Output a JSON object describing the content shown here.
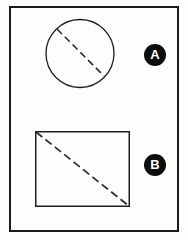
{
  "figure": {
    "background_color": "#fdfdfc",
    "stroke_color": "#1a1a1a",
    "badge_color": "#0d0d0d",
    "badge_text_color": "#ffffff",
    "frame": {
      "name": "outer-frame",
      "x": 9,
      "y": 6,
      "width": 170,
      "height": 226,
      "stroke_width": 2
    },
    "shapes": [
      {
        "id": "shape-a",
        "type": "circle",
        "label": "A",
        "cx": 80,
        "cy": 53.5,
        "r": 34,
        "stroke_width": 1.3,
        "dashed_line": {
          "name": "circle-dashed-diameter",
          "x1": 57,
          "y1": 29,
          "x2": 104,
          "y2": 76,
          "dash": "7 4",
          "stroke_width": 1.6
        }
      },
      {
        "id": "shape-b",
        "type": "rectangle",
        "label": "B",
        "x": 35,
        "y": 131,
        "width": 95,
        "height": 76,
        "stroke_width": 1.5,
        "dashed_line": {
          "name": "rectangle-dashed-diagonal",
          "x1": 36,
          "y1": 132,
          "x2": 129,
          "y2": 206,
          "dash": "8 4",
          "stroke_width": 1.7
        }
      }
    ],
    "badges": [
      {
        "id": "badge-a",
        "label": "A",
        "cx": 155,
        "cy": 55,
        "diameter": 22
      },
      {
        "id": "badge-b",
        "label": "B",
        "cx": 155,
        "cy": 165,
        "diameter": 22
      }
    ]
  }
}
